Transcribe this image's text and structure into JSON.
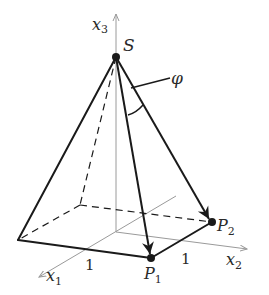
{
  "diagram": {
    "type": "pyramid-3d",
    "labels": {
      "apex": "S",
      "axis_x1": "x",
      "axis_x1_sub": "1",
      "axis_x2": "x",
      "axis_x2_sub": "2",
      "axis_x3": "x",
      "axis_x3_sub": "3",
      "point_p1": "P",
      "point_p1_sub": "1",
      "point_p2": "P",
      "point_p2_sub": "2",
      "angle": "φ",
      "tick_x1": "1",
      "tick_x2": "1"
    },
    "colors": {
      "edge": "#1a1a1a",
      "axis": "#9a9a9a",
      "text": "#2a2a2a"
    }
  }
}
